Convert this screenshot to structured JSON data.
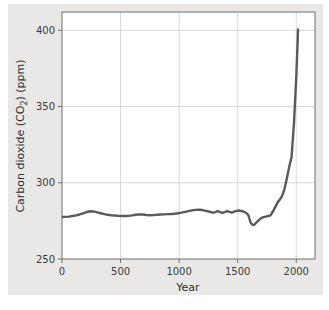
{
  "figure": {
    "background_color": "#ffffff",
    "panel_color": "#e9e8e6",
    "plot_background_color": "#ffffff",
    "frame_color": "#6e6e6e",
    "grid_color": "#cfcfcf"
  },
  "chart_data": {
    "type": "line",
    "title": "",
    "subtitle": "",
    "xlabel": "Year",
    "ylabel": "Carbon dioxide (CO2) (ppm)",
    "ylabel_parts": {
      "before": "Carbon dioxide (CO",
      "subscript": "2",
      "after": ") (ppm)"
    },
    "xlim": [
      0,
      2160
    ],
    "ylim": [
      250,
      412
    ],
    "xticks": [
      0,
      500,
      1000,
      1500,
      2000
    ],
    "xtick_labels": [
      "0",
      "500",
      "1000",
      "1500",
      "2000"
    ],
    "yticks": [
      250,
      300,
      350,
      400
    ],
    "ytick_labels": [
      "250",
      "300",
      "350",
      "400"
    ],
    "grid": true,
    "grid_axis": "both",
    "legend": false,
    "legend_position": "none",
    "series": [
      {
        "name": "Atmospheric CO2 concentration",
        "color": "#5a5a5a",
        "line_width": 2.4,
        "x": [
          0,
          30,
          60,
          90,
          120,
          150,
          180,
          210,
          240,
          270,
          300,
          330,
          360,
          390,
          420,
          450,
          480,
          510,
          540,
          570,
          600,
          630,
          660,
          690,
          720,
          750,
          780,
          810,
          840,
          870,
          900,
          930,
          960,
          990,
          1020,
          1050,
          1080,
          1110,
          1140,
          1170,
          1200,
          1230,
          1260,
          1290,
          1310,
          1330,
          1350,
          1370,
          1390,
          1410,
          1430,
          1450,
          1470,
          1490,
          1510,
          1530,
          1550,
          1570,
          1590,
          1600,
          1610,
          1625,
          1640,
          1660,
          1680,
          1700,
          1720,
          1740,
          1760,
          1780,
          1800,
          1820,
          1840,
          1860,
          1880,
          1900,
          1920,
          1940,
          1960,
          1980,
          2000,
          2010,
          2015
        ],
        "y": [
          277.5,
          277.6,
          277.8,
          278.2,
          278.6,
          279.2,
          280.0,
          280.8,
          281.3,
          281.2,
          280.6,
          280.0,
          279.4,
          279.0,
          278.7,
          278.5,
          278.3,
          278.2,
          278.2,
          278.3,
          278.6,
          279.0,
          279.3,
          279.2,
          278.9,
          278.7,
          278.8,
          279.0,
          279.2,
          279.3,
          279.4,
          279.5,
          279.7,
          280.0,
          280.4,
          280.9,
          281.4,
          281.9,
          282.2,
          282.3,
          282.1,
          281.6,
          281.0,
          280.4,
          280.8,
          281.5,
          280.8,
          280.2,
          280.7,
          281.4,
          280.9,
          280.4,
          281.0,
          281.6,
          281.8,
          281.5,
          281.0,
          280.4,
          279.0,
          276.5,
          274.0,
          272.5,
          272.3,
          274.0,
          275.5,
          276.8,
          277.5,
          277.8,
          278.2,
          278.6,
          281.0,
          284.0,
          287.0,
          289.0,
          291.5,
          296.0,
          303.0,
          310.5,
          317.0,
          338.5,
          369.0,
          389.0,
          400.5
        ]
      }
    ],
    "annotations": []
  }
}
